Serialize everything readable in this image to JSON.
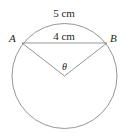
{
  "diagram": {
    "arc_label": "5 cm",
    "chord_label": "4 cm",
    "point_a": "A",
    "point_b": "B",
    "angle_label": "θ",
    "colors": {
      "stroke": "#8a8a8a",
      "text": "#231f20",
      "background": "#ffffff"
    }
  }
}
